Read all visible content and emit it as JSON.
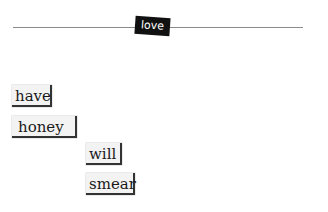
{
  "canvas": {
    "background": "#ffffff",
    "divider_color": "#8a8a8a"
  },
  "anchor_tile": {
    "label": "love",
    "background": "#111111",
    "text_color": "#ffffff"
  },
  "word_tiles": [
    {
      "label": "have"
    },
    {
      "label": "honey"
    },
    {
      "label": "will"
    },
    {
      "label": "smear"
    }
  ],
  "tile_style": {
    "background": "#f3f3f3",
    "shadow_color": "#333333"
  }
}
